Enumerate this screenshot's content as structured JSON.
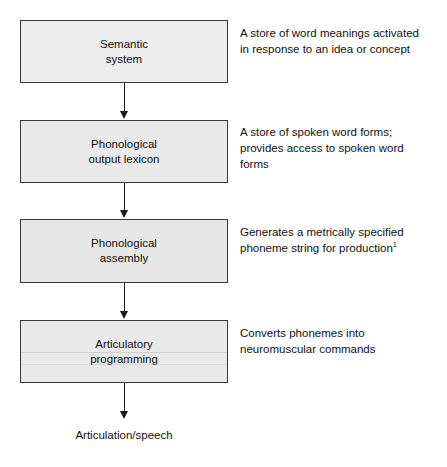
{
  "diagram": {
    "box_fill_color": "#e9e9e9",
    "box_border_color": "#3a3a3a",
    "arrow_color": "#1a1a1a",
    "text_color": "#111111",
    "stages": [
      {
        "id": "semantic-system",
        "lines": [
          "Semantic",
          "system"
        ],
        "description_lines": [
          "A store of word meanings activated",
          "in response to an idea or concept"
        ]
      },
      {
        "id": "phonological-output-lexicon",
        "lines": [
          "Phonological",
          "output lexicon"
        ],
        "description_lines": [
          "A store of spoken word forms;",
          "provides access to spoken word",
          "forms"
        ]
      },
      {
        "id": "phonological-assembly",
        "lines": [
          "Phonological",
          "assembly"
        ],
        "description_lines": [
          "Generates a metrically specified",
          "phoneme string for production"
        ],
        "description_superscript": "1"
      },
      {
        "id": "articulatory-programming",
        "lines": [
          "Articulatory",
          "programming"
        ],
        "description_lines": [
          "Converts phonemes into",
          "neuromuscular commands"
        ]
      }
    ],
    "output_label": "Articulation/speech"
  }
}
